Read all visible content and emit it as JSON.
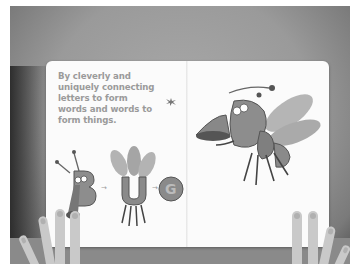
{
  "scene": {
    "description": "Photo of an open children's board book held by two hands, on a gray background",
    "colors": {
      "background": "#9a9a9a",
      "page": "#fbfbfb",
      "text": "#9a9a9a",
      "illustration": "#8a8a8a"
    }
  },
  "book": {
    "left_page": {
      "text_lines": [
        "By cleverly and",
        "uniquely connecting",
        "letters to form",
        "words and words to",
        "form things."
      ],
      "illustration": {
        "letters": [
          "B",
          "U",
          "G"
        ],
        "arrows": [
          "→",
          "→"
        ],
        "decoration": "splat-icon"
      }
    },
    "right_page": {
      "illustration": {
        "subject": "bug creature formed from letters",
        "letters": [
          "B",
          "U",
          "G"
        ]
      }
    }
  }
}
